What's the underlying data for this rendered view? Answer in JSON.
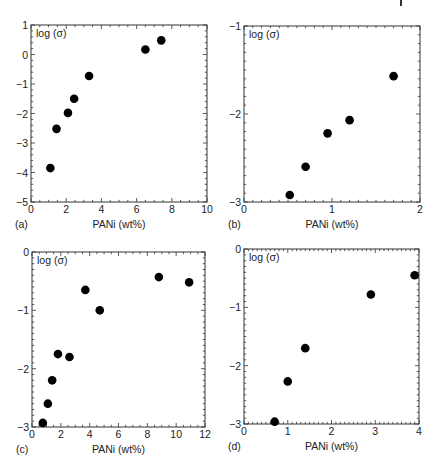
{
  "figure": {
    "page_marker": "I",
    "panel_letters": [
      "(a)",
      "(b)",
      "(c)",
      "(d)"
    ]
  },
  "chart_data": [
    {
      "id": "a",
      "type": "scatter",
      "panel_label": "(a)",
      "title": "",
      "xlabel": "PANi (wt%)",
      "ylabel": "log (σ)",
      "xlim": [
        0,
        10
      ],
      "ylim": [
        -5,
        1
      ],
      "xticks": [
        0,
        2,
        4,
        6,
        8,
        10
      ],
      "yticks": [
        -5,
        -4,
        -3,
        -2,
        -1,
        0,
        1
      ],
      "xminor": 0.5,
      "yminor": 0.2,
      "grid": false,
      "legend": null,
      "box": {
        "left": 31,
        "top": 25,
        "right": 207,
        "bottom": 202
      },
      "x": [
        1.1,
        1.45,
        2.1,
        2.45,
        3.3,
        6.5,
        7.4
      ],
      "y": [
        -3.85,
        -2.52,
        -1.98,
        -1.5,
        -0.73,
        0.17,
        0.48
      ]
    },
    {
      "id": "b",
      "type": "scatter",
      "panel_label": "(b)",
      "title": "",
      "xlabel": "PANi (wt%)",
      "ylabel": "log (σ)",
      "xlim": [
        0,
        2
      ],
      "ylim": [
        -3,
        -1
      ],
      "xticks": [
        0,
        1,
        2
      ],
      "yticks": [
        -3,
        -2,
        -1
      ],
      "xminor": 0.1,
      "yminor": 0.1,
      "grid": false,
      "legend": null,
      "box": {
        "left": 244,
        "top": 26,
        "right": 420,
        "bottom": 202
      },
      "x": [
        0.52,
        0.7,
        0.95,
        1.2,
        1.7
      ],
      "y": [
        -2.92,
        -2.6,
        -2.22,
        -2.07,
        -1.57
      ]
    },
    {
      "id": "c",
      "type": "scatter",
      "panel_label": "(c)",
      "title": "",
      "xlabel": "PANi (wt%)",
      "ylabel": "log (σ)",
      "xlim": [
        0,
        12
      ],
      "ylim": [
        -3,
        0
      ],
      "xticks": [
        0,
        2,
        4,
        6,
        8,
        10,
        12
      ],
      "yticks": [
        -3,
        -2,
        -1,
        0
      ],
      "xminor": 0.5,
      "yminor": 0.1,
      "grid": false,
      "legend": null,
      "box": {
        "left": 32,
        "top": 252,
        "right": 205,
        "bottom": 427
      },
      "x": [
        0.75,
        1.1,
        1.4,
        1.8,
        2.6,
        3.7,
        4.7,
        8.8,
        10.9
      ],
      "y": [
        -2.93,
        -2.6,
        -2.2,
        -1.75,
        -1.8,
        -0.65,
        -1.0,
        -0.43,
        -0.52
      ]
    },
    {
      "id": "d",
      "type": "scatter",
      "panel_label": "(d)",
      "title": "",
      "xlabel": "PANi (wt%)",
      "ylabel": "log (σ)",
      "xlim": [
        0,
        4
      ],
      "ylim": [
        -3,
        0
      ],
      "xticks": [
        0,
        1,
        2,
        3,
        4
      ],
      "yticks": [
        -3,
        -2,
        -1,
        0
      ],
      "xminor": 0.1,
      "yminor": 0.1,
      "grid": false,
      "legend": null,
      "box": {
        "left": 244,
        "top": 249,
        "right": 419,
        "bottom": 424
      },
      "x": [
        0.7,
        1.0,
        1.4,
        2.9,
        3.9
      ],
      "y": [
        -2.96,
        -2.27,
        -1.7,
        -0.78,
        -0.45
      ]
    }
  ]
}
